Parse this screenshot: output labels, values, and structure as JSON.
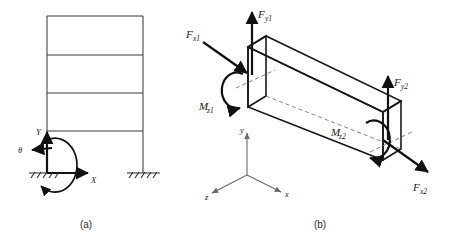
{
  "figure": {
    "background_color": "#ffffff",
    "line_color": "#1a1a1a"
  },
  "panel_a": {
    "caption": "(a)",
    "description": "Multi-storey plane frame with fixed supports and global coordinate system",
    "storey_count": 4,
    "axes": {
      "x_label": "X",
      "y_label": "Y",
      "rotation_label": "θ"
    },
    "supports": [
      "fixed-left",
      "fixed-right"
    ]
  },
  "panel_b": {
    "caption": "(b)",
    "description": "Three-dimensional beam element showing nodal end forces and moments",
    "triad": {
      "x_label": "x",
      "y_label": "y",
      "z_label": "z"
    },
    "node1_loads": [
      {
        "name": "F_x1",
        "base": "F",
        "sub": "x1"
      },
      {
        "name": "F_y1",
        "base": "F",
        "sub": "y1"
      },
      {
        "name": "M_z1",
        "base": "M",
        "sub": "z1"
      }
    ],
    "node2_loads": [
      {
        "name": "F_x2",
        "base": "F",
        "sub": "x2"
      },
      {
        "name": "F_y2",
        "base": "F",
        "sub": "y2"
      },
      {
        "name": "M_z2",
        "base": "M",
        "sub": "z2"
      }
    ]
  },
  "labels": {
    "a_x": "X",
    "a_y": "Y",
    "a_theta": "θ",
    "b_fx1_base": "F",
    "b_fx1_sub": "x1",
    "b_fy1_base": "F",
    "b_fy1_sub": "y1",
    "b_mz1_base": "M",
    "b_mz1_sub": "z1",
    "b_fy2_base": "F",
    "b_fy2_sub": "y2",
    "b_mz2_base": "M",
    "b_mz2_sub": "z2",
    "b_fx2_base": "F",
    "b_fx2_sub": "x2",
    "b_triad_x": "x",
    "b_triad_y": "y",
    "b_triad_z": "z",
    "caption_a": "(a)",
    "caption_b": "(b)"
  }
}
